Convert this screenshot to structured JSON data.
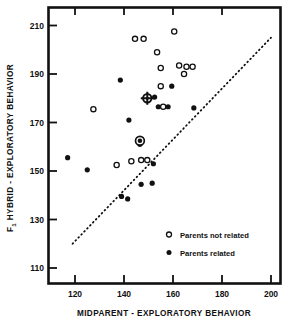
{
  "chart_data": {
    "type": "scatter",
    "title": "",
    "xlabel": "MIDPARENT - EXPLORATORY BEHAVIOR",
    "ylabel": "F1 HYBRID - EXPLORATORY BEHAVIOR",
    "ylabel_prefix": "F",
    "ylabel_subscript": "1",
    "ylabel_rest": " HYBRID - EXPLORATORY BEHAVIOR",
    "xlim": [
      110,
      203
    ],
    "ylim": [
      106,
      215
    ],
    "xticks": [
      120,
      140,
      160,
      180,
      200
    ],
    "yticks": [
      110,
      130,
      150,
      170,
      190,
      210
    ],
    "xtick_labels": [
      "120",
      "140",
      "160",
      "180",
      "200"
    ],
    "ytick_labels": [
      "110",
      "130",
      "150",
      "170",
      "190",
      "210"
    ],
    "grid": false,
    "legend_position": "lower-right-inside",
    "reference_line": {
      "style": "dotted",
      "x": [
        119,
        200
      ],
      "y": [
        120,
        205
      ]
    },
    "series": [
      {
        "name": "Parents not related",
        "marker": "open-circle",
        "color": "#111111",
        "points": [
          [
            144.5,
            204.5
          ],
          [
            148.0,
            204.5
          ],
          [
            160.5,
            207.5
          ],
          [
            153.5,
            199.0
          ],
          [
            155.0,
            192.5
          ],
          [
            162.5,
            193.5
          ],
          [
            165.5,
            193.0
          ],
          [
            168.0,
            193.0
          ],
          [
            164.5,
            190.0
          ],
          [
            155.0,
            185.0
          ],
          [
            156.0,
            176.5
          ],
          [
            127.5,
            175.5
          ],
          [
            146.0,
            162.5
          ],
          [
            147.0,
            154.5
          ],
          [
            143.0,
            154.0
          ],
          [
            149.5,
            154.5
          ],
          [
            137.0,
            152.5
          ]
        ]
      },
      {
        "name": "Parents related",
        "marker": "filled-circle",
        "color": "#111111",
        "points": [
          [
            138.5,
            187.5
          ],
          [
            159.5,
            185.0
          ],
          [
            152.5,
            180.5
          ],
          [
            154.0,
            176.5
          ],
          [
            158.0,
            176.5
          ],
          [
            168.5,
            176.0
          ],
          [
            142.0,
            171.0
          ],
          [
            146.5,
            161.0
          ],
          [
            152.0,
            153.0
          ],
          [
            117.0,
            155.5
          ],
          [
            125.0,
            150.5
          ],
          [
            147.0,
            144.5
          ],
          [
            151.5,
            145.0
          ],
          [
            139.0,
            139.5
          ],
          [
            141.5,
            138.5
          ]
        ]
      }
    ],
    "special_markers": [
      {
        "name": "midparent-mean-crosshair",
        "marker": "circle-with-cross",
        "x": 149.5,
        "y": 180.0
      },
      {
        "name": "circled-filled-point",
        "marker": "filled-circle-ringed",
        "x": 146.5,
        "y": 162.5
      }
    ],
    "legend": [
      {
        "marker": "open-circle",
        "label": "Parents not related"
      },
      {
        "marker": "filled-circle",
        "label": "Parents related"
      }
    ]
  }
}
